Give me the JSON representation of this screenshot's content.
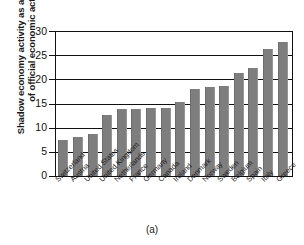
{
  "figure": {
    "caption": "(a)"
  },
  "chart_data": {
    "type": "bar",
    "title": "",
    "xlabel": "",
    "ylabel": "Shadow economy activity as a percentage of official economic activity",
    "ylabel_line1": "Shadow economy activity as a percentage",
    "ylabel_line2": "of official economic activity",
    "categories": [
      "Switzerland",
      "Austria",
      "United States",
      "United Kingdom",
      "Netherlands",
      "France",
      "Germany",
      "Canada",
      "Ireland",
      "Denmark",
      "Norway",
      "Sweden",
      "Belgium",
      "Spain",
      "Italy",
      "Greece"
    ],
    "values": [
      7.5,
      8.1,
      8.7,
      12.6,
      13.8,
      13.9,
      14.0,
      14.1,
      15.4,
      17.9,
      18.4,
      18.6,
      21.3,
      22.4,
      26.3,
      27.8
    ],
    "ylim": [
      0,
      30
    ],
    "yticks": [
      0,
      5,
      10,
      15,
      20,
      25,
      30
    ],
    "ytick_labels": [
      "0",
      "5",
      "10",
      "15",
      "20",
      "25",
      "30"
    ],
    "grid": "horizontal",
    "legend": "none",
    "bar_color": "#7e7e7e",
    "axis_color": "#111111"
  }
}
